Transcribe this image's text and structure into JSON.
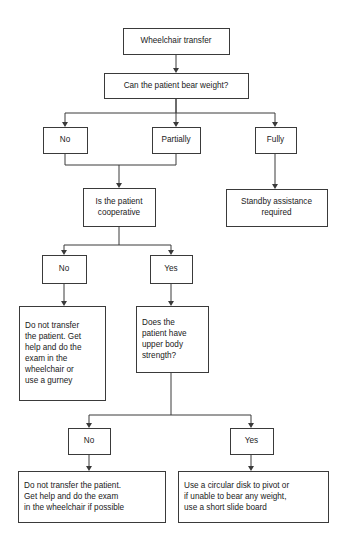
{
  "diagram": {
    "type": "flowchart",
    "background_color": "#ffffff",
    "box_border_color": "#3a3a3a",
    "text_color": "#1a1a1a",
    "nodes": [
      {
        "id": "start",
        "label": "Wheelchair transfer",
        "lines": [
          "Wheelchair transfer"
        ],
        "align": "center",
        "x": 123,
        "y": 28,
        "w": 106,
        "h": 26
      },
      {
        "id": "bear-weight",
        "label": "Can the patient bear weight?",
        "lines": [
          "Can the patient bear weight?"
        ],
        "align": "center",
        "x": 104,
        "y": 73,
        "w": 144,
        "h": 25
      },
      {
        "id": "weight-no",
        "label": "No",
        "lines": [
          "No"
        ],
        "align": "center",
        "x": 43,
        "y": 127,
        "w": 44,
        "h": 26
      },
      {
        "id": "weight-partially",
        "label": "Partially",
        "lines": [
          "Partially"
        ],
        "align": "center",
        "x": 152,
        "y": 127,
        "w": 48,
        "h": 26
      },
      {
        "id": "weight-fully",
        "label": "Fully",
        "lines": [
          "Fully"
        ],
        "align": "center",
        "x": 255,
        "y": 127,
        "w": 41,
        "h": 26
      },
      {
        "id": "standby",
        "label": "Standby assistance required",
        "lines": [
          "Standby assistance",
          "required"
        ],
        "align": "center",
        "x": 226,
        "y": 189,
        "w": 101,
        "h": 37
      },
      {
        "id": "cooperative",
        "label": "Is the patient cooperative",
        "lines": [
          "Is the patient",
          "cooperative"
        ],
        "align": "center",
        "x": 83,
        "y": 188,
        "w": 72,
        "h": 38
      },
      {
        "id": "coop-no",
        "label": "No",
        "lines": [
          "No"
        ],
        "align": "center",
        "x": 42,
        "y": 255,
        "w": 44,
        "h": 28
      },
      {
        "id": "coop-yes",
        "label": "Yes",
        "lines": [
          "Yes"
        ],
        "align": "center",
        "x": 150,
        "y": 255,
        "w": 42,
        "h": 28
      },
      {
        "id": "no-transfer-gurney",
        "label": "Do not transfer the patient. Get help and do the exam in the wheelchair or use a gurney",
        "lines": [
          "Do not transfer",
          "the patient. Get",
          "help and do the",
          "exam in the",
          "wheelchair or",
          "use a gurney"
        ],
        "align": "left",
        "x": 19,
        "y": 306,
        "w": 86,
        "h": 94
      },
      {
        "id": "upper-body",
        "label": "Does the patient have upper body strength?",
        "lines": [
          "Does the",
          "patient have",
          "upper body",
          "strength?"
        ],
        "align": "left",
        "x": 136,
        "y": 306,
        "w": 72,
        "h": 66
      },
      {
        "id": "upper-no",
        "label": "No",
        "lines": [
          "No"
        ],
        "align": "center",
        "x": 68,
        "y": 428,
        "w": 42,
        "h": 26
      },
      {
        "id": "upper-yes",
        "label": "Yes",
        "lines": [
          "Yes"
        ],
        "align": "center",
        "x": 230,
        "y": 428,
        "w": 43,
        "h": 26
      },
      {
        "id": "no-transfer-possible",
        "label": "Do not transfer the patient. Get help and do the exam in the wheelchair if possible",
        "lines": [
          "Do not transfer the patient.",
          "Get help and do the exam",
          "in the wheelchair if possible"
        ],
        "align": "left",
        "x": 18,
        "y": 471,
        "w": 147,
        "h": 51
      },
      {
        "id": "slide-board",
        "label": "Use a circular disk to pivot or if unable to bear any weight, use a short slide board",
        "lines": [
          "Use a circular disk to pivot or",
          "if unable to bear any weight,",
          "use a short slide board"
        ],
        "align": "left",
        "x": 178,
        "y": 471,
        "w": 150,
        "h": 51
      }
    ],
    "edges": [
      {
        "id": "e-start-weight",
        "from": "start",
        "to": "bear-weight",
        "path": "M176,54 L176,69",
        "arrow": {
          "x": 176,
          "y": 73,
          "dir": "down"
        }
      },
      {
        "id": "e-weight-no",
        "from": "bear-weight",
        "to": "weight-no",
        "path": "M176,98 L176,113 L65,113 L65,123",
        "arrow": {
          "x": 65,
          "y": 127,
          "dir": "down"
        }
      },
      {
        "id": "e-weight-partially",
        "from": "bear-weight",
        "to": "weight-partially",
        "path": "M176,98 L176,123",
        "arrow": {
          "x": 176,
          "y": 127,
          "dir": "down"
        }
      },
      {
        "id": "e-weight-fully",
        "from": "bear-weight",
        "to": "weight-fully",
        "path": "M176,113 L275,113 L275,123",
        "arrow": {
          "x": 275,
          "y": 127,
          "dir": "down"
        }
      },
      {
        "id": "e-fully-standby",
        "from": "weight-fully",
        "to": "standby",
        "path": "M275,153 L275,185",
        "arrow": {
          "x": 275,
          "y": 189,
          "dir": "down"
        }
      },
      {
        "id": "e-no-coop",
        "from": "weight-no",
        "to": "cooperative",
        "path": "M65,153 L65,165 L119,165 L119,184",
        "arrow": {
          "x": 119,
          "y": 188,
          "dir": "down"
        }
      },
      {
        "id": "e-partially-coop",
        "from": "weight-partially",
        "to": "cooperative",
        "path": "M176,153 L176,165 L119,165",
        "arrow": null
      },
      {
        "id": "e-coop-no",
        "from": "cooperative",
        "to": "coop-no",
        "path": "M119,226 L119,245 L64,245 L64,251",
        "arrow": {
          "x": 64,
          "y": 255,
          "dir": "down"
        }
      },
      {
        "id": "e-coop-yes",
        "from": "cooperative",
        "to": "coop-yes",
        "path": "M119,245 L171,245 L171,251",
        "arrow": {
          "x": 171,
          "y": 255,
          "dir": "down"
        }
      },
      {
        "id": "e-no-gurney",
        "from": "coop-no",
        "to": "no-transfer-gurney",
        "path": "M64,283 L64,302",
        "arrow": {
          "x": 64,
          "y": 306,
          "dir": "down"
        }
      },
      {
        "id": "e-yes-upper",
        "from": "coop-yes",
        "to": "upper-body",
        "path": "M171,283 L171,302",
        "arrow": {
          "x": 171,
          "y": 306,
          "dir": "down"
        }
      },
      {
        "id": "e-upper-no",
        "from": "upper-body",
        "to": "upper-no",
        "path": "M171,372 L171,415 L89,415 L89,424",
        "arrow": {
          "x": 89,
          "y": 428,
          "dir": "down"
        }
      },
      {
        "id": "e-upper-yes",
        "from": "upper-body",
        "to": "upper-yes",
        "path": "M171,415 L251,415 L251,424",
        "arrow": {
          "x": 251,
          "y": 428,
          "dir": "down"
        }
      },
      {
        "id": "e-no-possible",
        "from": "upper-no",
        "to": "no-transfer-possible",
        "path": "M89,454 L89,467",
        "arrow": {
          "x": 89,
          "y": 471,
          "dir": "down"
        }
      },
      {
        "id": "e-yes-slide",
        "from": "upper-yes",
        "to": "slide-board",
        "path": "M251,454 L251,467",
        "arrow": {
          "x": 251,
          "y": 471,
          "dir": "down"
        }
      }
    ]
  }
}
